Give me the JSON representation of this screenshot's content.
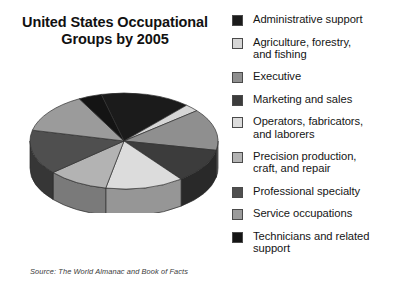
{
  "chart_data": {
    "type": "pie",
    "title": "United States Occupational Groups by 2005",
    "source": "Source: The World Almanac and Book of Facts",
    "three_d": true,
    "legend_position": "right",
    "categories": [
      "Administrative support",
      "Agriculture, forestry, and fishing",
      "Executive",
      "Marketing and sales",
      "Operators, fabricators, and laborers",
      "Precision production, craft, and repair",
      "Professional specialty",
      "Service occupations",
      "Technicians and related support"
    ],
    "values": [
      15.5,
      2.5,
      14.0,
      11.5,
      13.5,
      10.5,
      15.0,
      13.5,
      4.0
    ],
    "colors": [
      "#1b1b1b",
      "#d6d6d6",
      "#8f8f8f",
      "#3c3c3c",
      "#dcdcdc",
      "#b3b3b3",
      "#4f4f4f",
      "#9b9b9b",
      "#141414"
    ]
  },
  "title": {
    "line1": "United States Occupational",
    "line2": "Groups by 2005"
  },
  "source": {
    "text": "Source: The World Almanac and Book of Facts"
  },
  "legend": {
    "items": [
      {
        "label_line1": "Administrative support",
        "label_line2": "",
        "color": "#1b1b1b"
      },
      {
        "label_line1": "Agriculture, forestry,",
        "label_line2": "and fishing",
        "color": "#d6d6d6"
      },
      {
        "label_line1": "Executive",
        "label_line2": "",
        "color": "#8f8f8f"
      },
      {
        "label_line1": "Marketing and sales",
        "label_line2": "",
        "color": "#3c3c3c"
      },
      {
        "label_line1": "Operators, fabricators,",
        "label_line2": "and laborers",
        "color": "#dcdcdc"
      },
      {
        "label_line1": "Precision production,",
        "label_line2": "craft, and repair",
        "color": "#b3b3b3"
      },
      {
        "label_line1": "Professional specialty",
        "label_line2": "",
        "color": "#4f4f4f"
      },
      {
        "label_line1": "Service occupations",
        "label_line2": "",
        "color": "#9b9b9b"
      },
      {
        "label_line1": "Technicians and related",
        "label_line2": "support",
        "color": "#141414"
      }
    ]
  }
}
